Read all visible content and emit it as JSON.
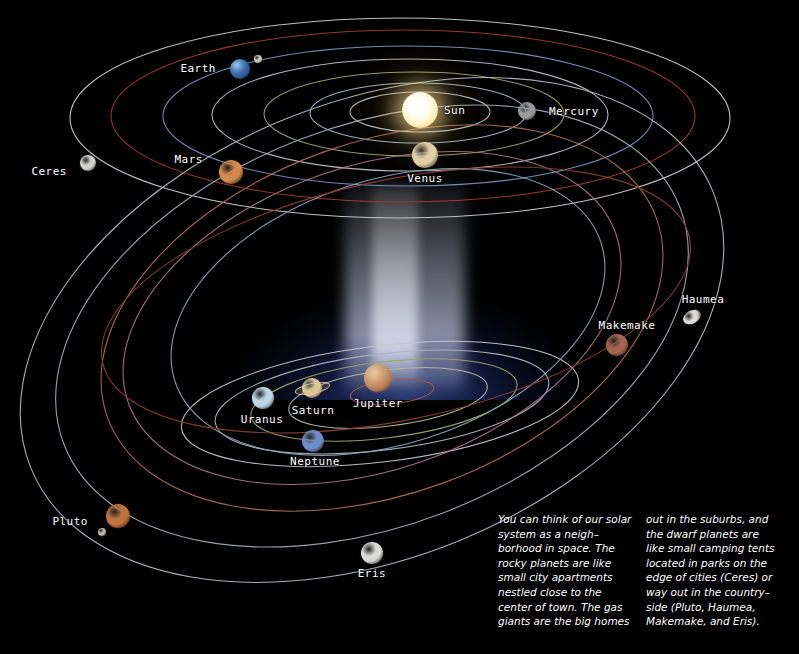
{
  "scene": {
    "title": "Solar System Neighborhood",
    "background_color": "#000000",
    "glow_color": "#28397a",
    "beam_color": "#dde2f5"
  },
  "bodies": [
    {
      "name": "Sun",
      "label": "Sun",
      "x": 420,
      "y": 110,
      "r": 18,
      "color": "#fff4c8",
      "label_x": 444,
      "label_y": 110,
      "label_align": "left"
    },
    {
      "name": "Mercury",
      "label": "Mercury",
      "x": 527,
      "y": 111,
      "r": 9,
      "color": "#9b9b9b",
      "label_x": 549,
      "label_y": 111,
      "label_align": "left"
    },
    {
      "name": "Venus",
      "label": "Venus",
      "x": 425,
      "y": 155,
      "r": 13,
      "color": "#e0cfa4",
      "label_x": 425,
      "label_y": 178,
      "label_align": "center"
    },
    {
      "name": "Earth",
      "label": "Earth",
      "x": 240,
      "y": 69,
      "r": 10,
      "color": "#3f6fb5",
      "label_x": 216,
      "label_y": 68,
      "label_align": "right"
    },
    {
      "name": "Moon",
      "label": "",
      "x": 258,
      "y": 59,
      "r": 4,
      "color": "#c9c6bd",
      "label_x": 0,
      "label_y": 0,
      "label_align": "center"
    },
    {
      "name": "Mars",
      "label": "Mars",
      "x": 231,
      "y": 172,
      "r": 12,
      "color": "#d4894a",
      "label_x": 203,
      "label_y": 159,
      "label_align": "right"
    },
    {
      "name": "Ceres",
      "label": "Ceres",
      "x": 88,
      "y": 163,
      "r": 8,
      "color": "#cfcfcd",
      "label_x": 67,
      "label_y": 171,
      "label_align": "right"
    },
    {
      "name": "Jupiter",
      "label": "Jupiter",
      "x": 378,
      "y": 378,
      "r": 14,
      "color": "#c99a72",
      "label_x": 378,
      "label_y": 403,
      "label_align": "center"
    },
    {
      "name": "Saturn",
      "label": "Saturn",
      "x": 312,
      "y": 388,
      "r": 10,
      "color": "#dcc68f",
      "label_x": 313,
      "label_y": 410,
      "label_align": "center"
    },
    {
      "name": "Uranus",
      "label": "Uranus",
      "x": 263,
      "y": 398,
      "r": 11,
      "color": "#bed7e6",
      "label_x": 262,
      "label_y": 419,
      "label_align": "center"
    },
    {
      "name": "Neptune",
      "label": "Neptune",
      "x": 313,
      "y": 441,
      "r": 11,
      "color": "#6e8ecb",
      "label_x": 315,
      "label_y": 461,
      "label_align": "center"
    },
    {
      "name": "Pluto",
      "label": "Pluto",
      "x": 118,
      "y": 516,
      "r": 12,
      "color": "#c1733f",
      "label_x": 88,
      "label_y": 521,
      "label_align": "right"
    },
    {
      "name": "Charon",
      "label": "",
      "x": 102,
      "y": 532,
      "r": 4,
      "color": "#b9b4ad",
      "label_x": 0,
      "label_y": 0,
      "label_align": "center"
    },
    {
      "name": "Eris",
      "label": "Eris",
      "x": 372,
      "y": 553,
      "r": 11,
      "color": "#d9d9d7",
      "label_x": 372,
      "label_y": 573,
      "label_align": "center"
    },
    {
      "name": "Makemake",
      "label": "Makemake",
      "x": 617,
      "y": 345,
      "r": 11,
      "color": "#a5644e",
      "label_x": 627,
      "label_y": 325,
      "label_align": "center"
    },
    {
      "name": "Haumea",
      "label": "Haumea",
      "x": 692,
      "y": 317,
      "r": 9,
      "color": "#ddd9d3",
      "label_x": 703,
      "label_y": 299,
      "label_align": "center"
    }
  ],
  "orbit_colors": {
    "white": "#c9cbd0",
    "red": "#9d3b33",
    "blue": "#6e86ba",
    "yellow_green": "#9aa36a",
    "pale_blue": "#9fb6c9",
    "salmon": "#b0705a",
    "mauve": "#a6768c"
  },
  "caption": {
    "column_1": "You can think of our solar system as a neigh–borhood in space. The rocky planets are like small city apartments nestled close to the center of town. The gas giants are the big homes",
    "column_2": "out in the suburbs, and the dwarf planets are like small camping tents located in parks on the edge of cities (Ceres) or way out in the country–side (Pluto, Haumea, Makemake, and Eris)."
  }
}
